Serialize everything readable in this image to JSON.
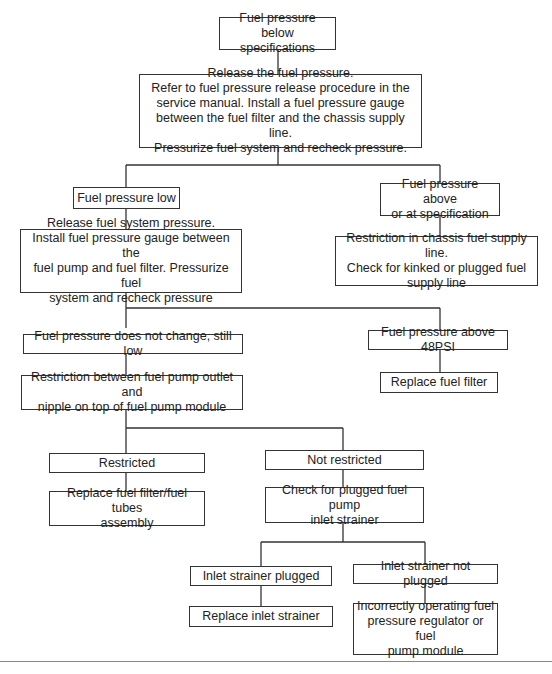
{
  "flowchart": {
    "title_node": "Fuel pressure\nbelow specifications",
    "nodes": {
      "release_pressure": "Release the fuel pressure.\nRefer to fuel pressure release procedure in the\nservice manual. Install a fuel pressure gauge\nbetween the fuel filter and the chassis supply line.\nPressurize fuel system and recheck pressure.",
      "pressure_low": "Fuel pressure low",
      "pressure_above": "Fuel pressure above\nor at specification",
      "release_system_pressure": "Release fuel system pressure.\nInstall fuel pressure gauge between the\nfuel pump and fuel filter. Pressurize fuel\nsystem and recheck pressure",
      "chassis_restriction": "Restriction in chassis fuel supply line.\nCheck for kinked or plugged fuel\nsupply line",
      "no_change": "Fuel pressure does not change, still low",
      "above_48psi": "Fuel pressure above 48PSI",
      "pump_outlet_restriction": "Restriction between fuel pump outlet and\nnipple on top of fuel pump module",
      "replace_filter": "Replace fuel filter",
      "restricted": "Restricted",
      "not_restricted": "Not restricted",
      "replace_filter_tubes": "Replace fuel filter/fuel tubes\nassembly",
      "check_strainer": "Check for plugged fuel pump\ninlet strainer",
      "strainer_plugged": "Inlet strainer plugged",
      "strainer_not_plugged": "Inlet strainer not plugged",
      "replace_strainer": "Replace inlet strainer",
      "regulator_or_module": "Incorrectly operating fuel\npressure regulator or fuel\npump module"
    }
  }
}
